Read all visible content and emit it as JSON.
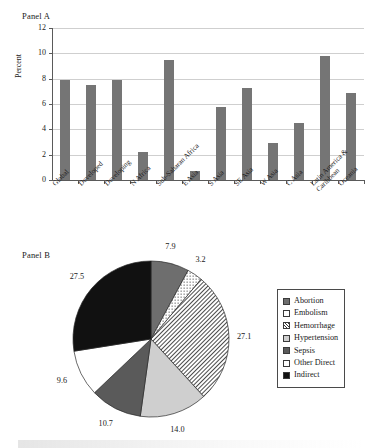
{
  "panel_a": {
    "label": "Panel A",
    "yaxis_title": "Percent",
    "yticks": [
      "0",
      "2",
      "4",
      "6",
      "8",
      "10",
      "12"
    ]
  },
  "panel_b": {
    "label": "Panel B"
  },
  "legend": {
    "items": [
      {
        "label": "Abortion",
        "swatch": "solid-gray"
      },
      {
        "label": "Embolism",
        "swatch": "dotted"
      },
      {
        "label": "Hemorrhage",
        "swatch": "hatch"
      },
      {
        "label": "Hypertension",
        "swatch": "light-gray"
      },
      {
        "label": "Sepsis",
        "swatch": "dark-gray"
      },
      {
        "label": "Other Direct",
        "swatch": "white"
      },
      {
        "label": "Indirect",
        "swatch": "black"
      }
    ]
  },
  "colors": {
    "bar_fill": "#757575",
    "gridline": "#cfcfcf",
    "axis": "#5a5a5a",
    "abortion": "#6e6e6e",
    "hypertension": "#cfcfcf",
    "sepsis": "#5a5a5a",
    "other_direct": "#ffffff",
    "indirect": "#111111"
  },
  "chart_data": [
    {
      "type": "bar",
      "title": "Panel A",
      "xlabel": "",
      "ylabel": "Percent",
      "ylim": [
        0,
        12
      ],
      "yticks": [
        0,
        2,
        4,
        6,
        8,
        10,
        12
      ],
      "grid": true,
      "legend": "none",
      "categories": [
        "Global",
        "Developed",
        "Developing",
        "N Africa",
        "Sub-Saharan Africa",
        "E Asia",
        "S Asia",
        "SE Asia",
        "W Asia",
        "C Asia",
        "Latin America & Caribbean",
        "Oceania"
      ],
      "values": [
        7.9,
        7.5,
        7.9,
        2.2,
        9.5,
        0.7,
        5.8,
        7.3,
        2.9,
        4.5,
        9.8,
        6.9
      ]
    },
    {
      "type": "pie",
      "title": "Panel B",
      "legend": "right",
      "start_angle_deg": 0,
      "direction": "clockwise",
      "labels": [
        "Abortion",
        "Embolism",
        "Hemorrhage",
        "Hypertension",
        "Sepsis",
        "Other Direct",
        "Indirect"
      ],
      "values": [
        7.9,
        3.2,
        27.1,
        14.0,
        10.7,
        9.6,
        27.5
      ],
      "value_labels": [
        "7.9",
        "3.2",
        "27.1",
        "14.0",
        "10.7",
        "9.6",
        "27.5"
      ]
    }
  ]
}
